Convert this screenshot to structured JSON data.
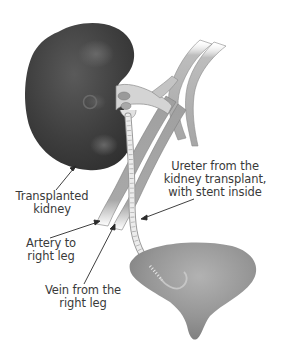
{
  "diagram": {
    "colors": {
      "kidney": "#3f3f3f",
      "vessel": "#9a9a9a",
      "vessel_light": "#c8c8c8",
      "ureter": "#e6e6e6",
      "bladder": "#8c8c8c",
      "label_text": "#3a3a3a",
      "leader_line": "#2a2a2a",
      "background": "#ffffff"
    },
    "labels": {
      "kidney": {
        "line1": "Transplanted",
        "line2": "kidney"
      },
      "artery": {
        "line1": "Artery to",
        "line2": "right leg"
      },
      "vein": {
        "line1": "Vein from the",
        "line2": "right leg"
      },
      "ureter": {
        "line1": "Ureter from the",
        "line2": "kidney transplant,",
        "line3": "with stent inside"
      }
    },
    "structures": [
      "transplanted-kidney",
      "renal-artery-vein-connection",
      "iliac-artery",
      "iliac-vein",
      "ureter-with-stent",
      "bladder"
    ]
  }
}
